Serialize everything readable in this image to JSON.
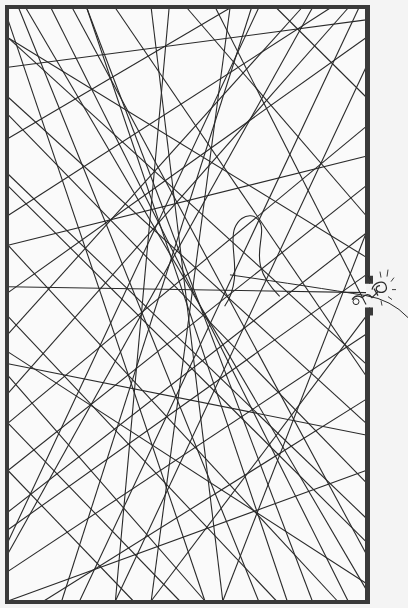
{
  "illustration": {
    "description": "Framed rectangle filled with a tangle of crossing string lines; a small figure escapes through an opening in the right wall pulling one thread out",
    "colors": {
      "background": "#f4f4f4",
      "paper": "#fafafa",
      "ink": "#2a2a2a",
      "frame": "#3a3a3a"
    },
    "gap": {
      "from": 0.465,
      "to": 0.505
    },
    "threads": [
      [
        0.0,
        0.02,
        0.55,
        1.0
      ],
      [
        0.03,
        0.0,
        0.7,
        1.0
      ],
      [
        0.12,
        0.0,
        0.95,
        1.0
      ],
      [
        0.3,
        0.0,
        1.0,
        0.62
      ],
      [
        0.5,
        0.0,
        1.0,
        0.35
      ],
      [
        0.75,
        0.0,
        1.0,
        0.15
      ],
      [
        0.0,
        0.1,
        1.0,
        0.02
      ],
      [
        0.0,
        0.22,
        0.62,
        0.0
      ],
      [
        0.0,
        0.35,
        0.9,
        0.0
      ],
      [
        0.0,
        0.48,
        1.0,
        0.05
      ],
      [
        0.0,
        0.55,
        0.82,
        0.0
      ],
      [
        0.0,
        0.7,
        1.0,
        0.2
      ],
      [
        0.0,
        0.85,
        1.0,
        0.38
      ],
      [
        0.0,
        0.95,
        1.0,
        0.55
      ],
      [
        0.0,
        1.0,
        1.0,
        0.78
      ],
      [
        0.1,
        1.0,
        1.0,
        0.66
      ],
      [
        0.2,
        1.0,
        0.98,
        0.0
      ],
      [
        0.4,
        1.0,
        0.62,
        0.0
      ],
      [
        0.6,
        1.0,
        0.4,
        0.0
      ],
      [
        0.85,
        1.0,
        0.22,
        0.0
      ],
      [
        1.0,
        0.98,
        0.05,
        0.0
      ],
      [
        1.0,
        0.9,
        0.0,
        0.3
      ],
      [
        1.0,
        0.8,
        0.0,
        0.18
      ],
      [
        1.0,
        0.72,
        0.0,
        0.6
      ],
      [
        1.0,
        0.6,
        0.0,
        0.05
      ],
      [
        1.0,
        0.45,
        0.0,
        0.88
      ],
      [
        1.0,
        0.3,
        0.0,
        0.78
      ],
      [
        1.0,
        0.25,
        0.0,
        0.4
      ],
      [
        0.95,
        0.0,
        0.0,
        0.65
      ],
      [
        0.85,
        0.0,
        0.0,
        0.92
      ],
      [
        0.68,
        0.0,
        0.15,
        1.0
      ],
      [
        0.45,
        0.0,
        0.3,
        1.0
      ],
      [
        0.22,
        0.0,
        0.78,
        1.0
      ],
      [
        0.0,
        0.62,
        0.55,
        1.0
      ],
      [
        0.0,
        0.78,
        0.35,
        1.0
      ],
      [
        0.0,
        0.4,
        0.92,
        1.0
      ],
      [
        0.0,
        0.28,
        1.0,
        0.86
      ],
      [
        0.0,
        0.15,
        1.0,
        0.7
      ],
      [
        0.0,
        0.05,
        1.0,
        0.42
      ],
      [
        0.18,
        0.0,
        1.0,
        0.92
      ],
      [
        0.58,
        0.0,
        1.0,
        0.5
      ],
      [
        0.0,
        0.47,
        1.0,
        0.48
      ],
      [
        0.0,
        0.9,
        0.7,
        0.0
      ],
      [
        0.3,
        1.0,
        1.0,
        0.1
      ],
      [
        0.48,
        1.0,
        0.0,
        0.7
      ],
      [
        0.75,
        1.0,
        0.0,
        0.52
      ],
      [
        1.0,
        0.52,
        0.4,
        1.0
      ],
      [
        1.0,
        0.38,
        0.6,
        1.0
      ],
      [
        0.0,
        0.58,
        1.0,
        0.97
      ]
    ],
    "loop": {
      "cx": 0.675,
      "cy": 0.385
    },
    "escaping_thread": [
      [
        0.62,
        0.45
      ],
      [
        0.85,
        0.47
      ],
      [
        1.0,
        0.485
      ]
    ]
  }
}
